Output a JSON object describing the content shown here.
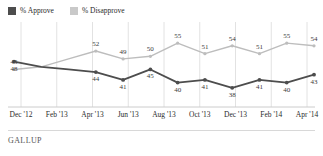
{
  "legend": {
    "items": [
      {
        "label": "% Approve",
        "color": "#4d4d4d",
        "name": "approve"
      },
      {
        "label": "% Disapprove",
        "color": "#c9c9c9",
        "name": "disapprove"
      }
    ]
  },
  "source": {
    "text": "GALLUP"
  },
  "colors": {
    "approve": "#4d4d4d",
    "disapprove": "#bdbdbd",
    "grid": "#e2e2e2",
    "axis": "#cccccc",
    "label": "#2b2b2b"
  },
  "chart_data": {
    "type": "line",
    "title": "",
    "subtitle": "",
    "xlabel": "",
    "ylabel": "",
    "ylim": [
      33,
      60
    ],
    "grid": true,
    "legend_position": "top-left",
    "x": [
      "Dec '12",
      "Feb '13",
      "Apr '13",
      "Jun '13",
      "Aug '13",
      "Oct '13",
      "Nov '13",
      "Dec '13",
      "Jan '14",
      "Feb '14",
      "Mar '14",
      "Apr '14"
    ],
    "tick_labels": [
      "Dec '12",
      "Feb '13",
      "Apr '13",
      "Jun '13",
      "Aug '13",
      "Oct '13",
      "Dec '13",
      "Feb '14",
      "Apr '14"
    ],
    "series": [
      {
        "name": "% Approve",
        "color": "#4d4d4d",
        "values": [
          48,
          46,
          45,
          44,
          41,
          45,
          40,
          41,
          38,
          41,
          40,
          43
        ],
        "point_labels": [
          "48",
          "",
          "",
          "44",
          "41",
          "45",
          "40",
          "41",
          "38",
          "41",
          "40",
          "43"
        ]
      },
      {
        "name": "% Disapprove",
        "color": "#bdbdbd",
        "values": [
          45,
          46,
          49,
          52,
          49,
          50,
          55,
          51,
          54,
          51,
          55,
          54
        ],
        "point_labels": [
          "45",
          "",
          "",
          "52",
          "49",
          "50",
          "55",
          "51",
          "54",
          "51",
          "55",
          "54"
        ]
      }
    ]
  }
}
